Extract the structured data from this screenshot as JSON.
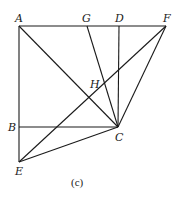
{
  "diagram": {
    "caption": "(c)",
    "points": {
      "A": {
        "label": "A",
        "x": 19,
        "y": 26
      },
      "G": {
        "label": "G",
        "x": 87,
        "y": 26
      },
      "D": {
        "label": "D",
        "x": 119,
        "y": 26
      },
      "F": {
        "label": "F",
        "x": 166,
        "y": 26
      },
      "H": {
        "label": "H",
        "x": 93,
        "y": 94
      },
      "B": {
        "label": "B",
        "x": 19,
        "y": 127
      },
      "C": {
        "label": "C",
        "x": 118,
        "y": 127
      },
      "E": {
        "label": "E",
        "x": 19,
        "y": 162
      }
    },
    "segments": [
      [
        "A",
        "F"
      ],
      [
        "A",
        "E"
      ],
      [
        "B",
        "C"
      ],
      [
        "A",
        "C"
      ],
      [
        "G",
        "C"
      ],
      [
        "D",
        "C"
      ],
      [
        "F",
        "C"
      ],
      [
        "E",
        "F"
      ],
      [
        "E",
        "C"
      ]
    ],
    "line_color": "#1a1a1a"
  }
}
